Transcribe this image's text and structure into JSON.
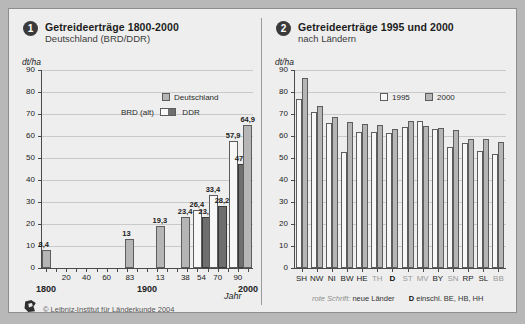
{
  "panel1": {
    "badge": "1",
    "title": "Getreideerträge 1800-2000",
    "subtitle": "Deutschland (BRD/DDR)",
    "unit": "dt/ha",
    "xaxis_label": "Jahr",
    "legend": [
      {
        "key": "deutschland",
        "label": "Deutschland",
        "swatch": "grey"
      },
      {
        "key": "brd_alt",
        "label": "BRD (alt)",
        "swatch": "white"
      },
      {
        "key": "ddr",
        "label": "DDR",
        "swatch": "dark"
      }
    ],
    "copyright": "© Leibniz-Institut für Länderkunde 2004",
    "logo_icon": "ifl-logo-icon"
  },
  "panel2": {
    "badge": "2",
    "title": "Getreideerträge 1995 und 2000",
    "subtitle": "nach Ländern",
    "unit": "dt/ha",
    "legend": [
      {
        "key": "y1995",
        "label": "1995",
        "swatch": "white"
      },
      {
        "key": "y2000",
        "label": "2000",
        "swatch": "grey"
      }
    ],
    "note_italic": "rote Schrift:",
    "note_text": "neue Länder",
    "note_bold": "D",
    "note_tail": "einschl. BE, HB, HH"
  },
  "chart_data": [
    {
      "type": "bar",
      "title": "Getreideerträge 1800-2000",
      "subtitle": "Deutschland (BRD/DDR)",
      "xlabel": "Jahr",
      "ylabel": "dt/ha",
      "ylim": [
        0,
        90
      ],
      "yticks": [
        0,
        10,
        20,
        30,
        40,
        50,
        60,
        70,
        80,
        90
      ],
      "grid": true,
      "legend_position": "top-right",
      "xticks": [
        "1800",
        "20",
        "40",
        "60",
        "83",
        "1900",
        "13",
        "38",
        "54",
        "70",
        "90",
        "2000"
      ],
      "bars": [
        {
          "year": "1800",
          "series": "Deutschland",
          "value": 8.4,
          "label": "8,4",
          "x": 1800
        },
        {
          "year": "1883",
          "series": "Deutschland",
          "value": 13,
          "label": "13",
          "x": 1883
        },
        {
          "year": "1913",
          "series": "Deutschland",
          "value": 19.3,
          "label": "19,3",
          "x": 1913
        },
        {
          "year": "1938",
          "series": "Deutschland",
          "value": 23.4,
          "label": "23,4",
          "x": 1938
        },
        {
          "year": "1954",
          "series": "BRD (alt)",
          "value": 26.4,
          "label": "26,4",
          "x": 1954
        },
        {
          "year": "1954",
          "series": "DDR",
          "value": 23.3,
          "label": "23,3",
          "x": 1954
        },
        {
          "year": "1970",
          "series": "BRD (alt)",
          "value": 33.4,
          "label": "33,4",
          "x": 1970
        },
        {
          "year": "1970",
          "series": "DDR",
          "value": 28.2,
          "label": "28,2",
          "x": 1970
        },
        {
          "year": "1990",
          "series": "BRD (alt)",
          "value": 57.9,
          "label": "57,9",
          "x": 1990
        },
        {
          "year": "1990",
          "series": "DDR",
          "value": 47.2,
          "label": "47,2",
          "x": 1990
        },
        {
          "year": "2000",
          "series": "Deutschland",
          "value": 64.9,
          "label": "64,9",
          "x": 2000
        }
      ]
    },
    {
      "type": "bar",
      "title": "Getreideerträge 1995 und 2000",
      "subtitle": "nach Ländern",
      "xlabel": "",
      "ylabel": "dt/ha",
      "ylim": [
        0,
        90
      ],
      "yticks": [
        0,
        10,
        20,
        30,
        40,
        50,
        60,
        70,
        80,
        90
      ],
      "grid": true,
      "legend_position": "top-center",
      "categories": [
        "SH",
        "NW",
        "NI",
        "BW",
        "HE",
        "TH",
        "D",
        "ST",
        "MV",
        "BY",
        "SN",
        "RP",
        "SL",
        "BB"
      ],
      "category_styles": [
        "normal",
        "normal",
        "normal",
        "normal",
        "normal",
        "red",
        "bold",
        "red",
        "red",
        "normal",
        "red",
        "normal",
        "normal",
        "red"
      ],
      "series": [
        {
          "name": "1995",
          "values": [
            77.0,
            71.0,
            65.8,
            52.8,
            62.0,
            61.6,
            61.2,
            64.0,
            66.6,
            63.4,
            55.0,
            56.8,
            53.2,
            51.6
          ]
        },
        {
          "name": "2000",
          "values": [
            86.3,
            73.8,
            68.6,
            66.2,
            65.4,
            64.8,
            63.0,
            66.8,
            64.4,
            63.6,
            62.8,
            58.8,
            58.6,
            57.4
          ]
        }
      ],
      "last_pair": {
        "category": "BB",
        "1995": 50.2,
        "2000": 42.0
      }
    }
  ]
}
